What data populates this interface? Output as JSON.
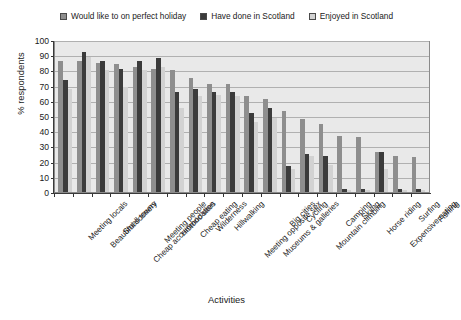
{
  "chart_data": {
    "type": "bar",
    "title": "",
    "xlabel": "Activities",
    "ylabel": "% respondents",
    "ylim": [
      0,
      100
    ],
    "ytick_step": 10,
    "yticks": [
      0,
      10,
      20,
      30,
      40,
      50,
      60,
      70,
      80,
      90,
      100
    ],
    "grid": true,
    "legend_position": "top-center",
    "categories": [
      "Meeting locals",
      "Beautiful scenery",
      "Small towns",
      "Cheap accommodation",
      "Meeting people",
      "Historic sites",
      "Cheap eating",
      "Wilderness",
      "Hillwalking",
      "Meeting opposite sex",
      "Museums & galleries",
      "Big cities",
      "Cycling",
      "Mountain climbing",
      "Camping",
      "Skiing",
      "Horse riding",
      "Expensive eating",
      "Surfing",
      "Fishing"
    ],
    "series": [
      {
        "name": "Would like to on perfect holiday",
        "color": "#8e8e8e",
        "values": [
          86,
          86,
          85,
          84,
          82,
          81,
          80,
          75,
          71,
          71,
          63,
          61,
          53,
          48,
          45,
          37,
          36,
          26,
          24,
          23
        ]
      },
      {
        "name": "Have done in Scotland",
        "color": "#3b3b3b",
        "values": [
          74,
          92,
          86,
          81,
          86,
          88,
          66,
          68,
          66,
          66,
          52,
          55,
          17,
          25,
          24,
          2,
          2,
          26,
          2,
          2
        ]
      },
      {
        "name": "Enjoyed in Scotland",
        "color": "#d2d2d2",
        "values": [
          68,
          89,
          80,
          69,
          80,
          82,
          55,
          63,
          64,
          63,
          46,
          49,
          15,
          24,
          18,
          1,
          1,
          15,
          1,
          1
        ]
      }
    ]
  },
  "legend": {
    "items": [
      {
        "label": "Would like to on perfect holiday",
        "color": "#8e8e8e"
      },
      {
        "label": "Have done in Scotland",
        "color": "#3b3b3b"
      },
      {
        "label": "Enjoyed in Scotland",
        "color": "#d2d2d2"
      }
    ]
  }
}
